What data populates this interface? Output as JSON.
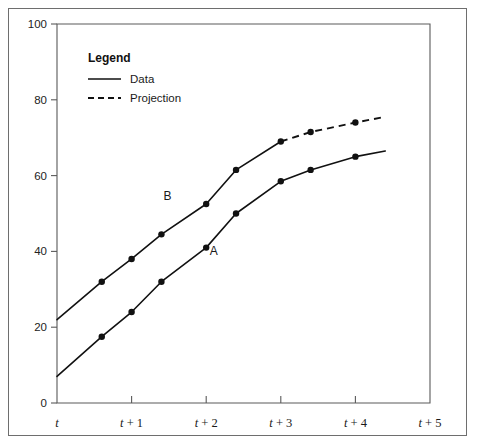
{
  "figure": {
    "background_color": "#ffffff",
    "frame_color": "#6e6e6e",
    "ink_color": "#111111"
  },
  "legend": {
    "title": "Legend",
    "entries": [
      {
        "label": "Data",
        "style": "solid"
      },
      {
        "label": "Projection",
        "style": "dashed"
      }
    ]
  },
  "axis_labels": {
    "y": [
      "0",
      "20",
      "40",
      "60",
      "80",
      "100"
    ],
    "x": [
      "t",
      "t + 1",
      "t + 2",
      "t + 3",
      "t + 4",
      "t + 5"
    ]
  },
  "curve_labels": {
    "a": "A",
    "b": "B"
  },
  "chart_data": {
    "type": "line",
    "title": "",
    "xlabel": "",
    "ylabel": "",
    "xlim": [
      0,
      5
    ],
    "ylim": [
      0,
      100
    ],
    "yticks": [
      0,
      20,
      40,
      60,
      80,
      100
    ],
    "xticks": [
      0,
      1,
      2,
      3,
      4,
      5
    ],
    "xticklabels": [
      "t",
      "t + 1",
      "t + 2",
      "t + 3",
      "t + 4",
      "t + 5"
    ],
    "grid": false,
    "legend_position": "upper-left-inside",
    "markers": "filled-circle",
    "series": [
      {
        "name": "B",
        "label": "B",
        "style": "solid",
        "segment": "data",
        "x": [
          0.0,
          0.6,
          1.0,
          1.4,
          2.0,
          2.4,
          3.0
        ],
        "values": [
          22.0,
          32.0,
          38.0,
          44.5,
          52.5,
          61.5,
          69.0
        ],
        "marker_x": [
          0.6,
          1.0,
          1.4,
          2.0,
          2.4,
          3.0
        ],
        "marker_values": [
          32.0,
          38.0,
          44.5,
          52.5,
          61.5,
          69.0
        ]
      },
      {
        "name": "B projection",
        "label": "B",
        "style": "dashed",
        "segment": "projection",
        "x": [
          3.0,
          3.4,
          4.0,
          4.4
        ],
        "values": [
          69.0,
          71.5,
          74.0,
          75.5
        ],
        "marker_x": [
          3.4,
          4.0
        ],
        "marker_values": [
          71.5,
          74.0
        ]
      },
      {
        "name": "A",
        "label": "A",
        "style": "solid",
        "segment": "data",
        "x": [
          0.0,
          0.6,
          1.0,
          1.4,
          2.0,
          2.4,
          3.0,
          3.4,
          4.0,
          4.4
        ],
        "values": [
          7.0,
          17.5,
          24.0,
          32.0,
          41.0,
          50.0,
          58.5,
          61.5,
          65.0,
          66.5
        ],
        "marker_x": [
          0.6,
          1.0,
          1.4,
          2.0,
          2.4,
          3.0,
          3.4,
          4.0
        ],
        "marker_values": [
          17.5,
          24.0,
          32.0,
          41.0,
          50.0,
          58.5,
          61.5,
          65.0
        ]
      }
    ],
    "annotations": [
      {
        "text": "B",
        "x": 1.48,
        "y": 53.5
      },
      {
        "text": "A",
        "x": 2.1,
        "y": 39.0
      }
    ]
  }
}
